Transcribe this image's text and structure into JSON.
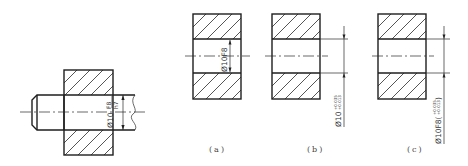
{
  "figure": {
    "assembly": {
      "fit_label": "Ø10",
      "hole_tolerance": "F8",
      "shaft_tolerance": "h7"
    },
    "parts": [
      {
        "caption": "(a)",
        "dimension_text": "Ø10F8",
        "upper_deviation": "",
        "lower_deviation": ""
      },
      {
        "caption": "(b)",
        "dimension_text": "Ø10",
        "upper_deviation": "+0.035",
        "lower_deviation": "+0.013"
      },
      {
        "caption": "(c)",
        "dimension_text": "Ø10F8(",
        "upper_deviation": "+0.035",
        "lower_deviation": "+0.013",
        "closing": ")"
      }
    ]
  }
}
